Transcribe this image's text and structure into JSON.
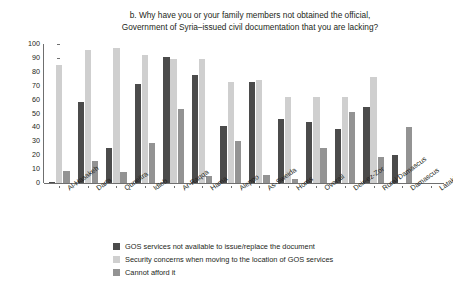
{
  "chart_data": {
    "type": "bar",
    "title": "b. Why have you or your family members not obtained the official, Government of Syria–issued civil documentation that you are lacking?",
    "title_lines": [
      "b. Why have you or your family members not obtained the official,",
      "Government of Syria–issued civil documentation that you are lacking?"
    ],
    "xlabel": "",
    "ylabel": "Share of responses (%)",
    "ylim": [
      0,
      100
    ],
    "yticks": [
      0,
      10,
      20,
      30,
      40,
      50,
      60,
      70,
      80,
      90,
      100
    ],
    "grid": false,
    "legend_position": "bottom-left",
    "categories": [
      "Al-Hasakeh",
      "Dar'a",
      "Quneitra",
      "Idleb",
      "Ar-Raqqa",
      "Hama",
      "Aleppo",
      "As-Sweida",
      "Homs",
      "Overall",
      "Deir-ez-Zor",
      "Rural Damascus",
      "Damascus",
      "Latakia"
    ],
    "series": [
      {
        "name": "GOS services not available to issue/replace the document",
        "color": "#4b4b4b",
        "values": [
          1,
          58,
          25,
          71,
          91,
          78,
          41,
          73,
          46,
          44,
          39,
          55,
          20,
          0
        ]
      },
      {
        "name": "Security concerns when moving to the location of GOS services",
        "color": "#cfcfcf",
        "values": [
          85,
          96,
          97,
          92,
          89,
          89,
          73,
          74,
          62,
          62,
          62,
          76,
          0,
          0
        ]
      },
      {
        "name": "Cannot afford it",
        "color": "#939393",
        "values": [
          9,
          16,
          8,
          29,
          53,
          5,
          30,
          6,
          3,
          25,
          51,
          19,
          40,
          0
        ]
      }
    ]
  },
  "axis": {
    "y_label": "Share of responses (%)"
  }
}
